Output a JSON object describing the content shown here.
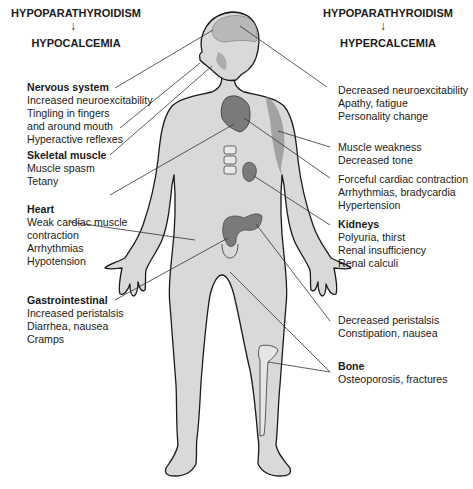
{
  "left_header": {
    "cause": "HYPOPARATHYROIDISM",
    "arrow": "↓",
    "effect": "HYPOCALCEMIA"
  },
  "right_header": {
    "cause": "HYPOPARATHYROIDISM",
    "arrow": "↓",
    "effect": "HYPERCALCEMIA"
  },
  "left_blocks": [
    {
      "title": "Nervous system",
      "lines": [
        "Increased neuroexcitability",
        "Tingling in fingers",
        "and around mouth",
        "Hyperactive reflexes"
      ]
    },
    {
      "title": "Skeletal muscle",
      "lines": [
        "Muscle spasm",
        "Tetany"
      ]
    },
    {
      "title": "Heart",
      "lines": [
        "Weak cardiac muscle",
        "contraction",
        "Arrhythmias",
        "Hypotension"
      ]
    },
    {
      "title": "Gastrointestinal",
      "lines": [
        "Increased peristalsis",
        "Diarrhea, nausea",
        "Cramps"
      ]
    }
  ],
  "right_blocks": [
    {
      "title": "",
      "lines": [
        "Decreased neuroexcitability",
        "Apathy, fatigue",
        "Personality change"
      ]
    },
    {
      "title": "",
      "lines": [
        "Muscle weakness",
        "Decreased tone"
      ]
    },
    {
      "title": "",
      "lines": [
        "Forceful cardiac contraction",
        "Arrhythmias, bradycardia",
        "Hypertension"
      ]
    },
    {
      "title": "Kidneys",
      "lines": [
        "Polyuria, thirst",
        "Renal insufficiency",
        "Renal calculi"
      ]
    },
    {
      "title": "",
      "lines": [
        "Decreased peristalsis",
        "Constipation, nausea"
      ]
    },
    {
      "title": "Bone",
      "lines": [
        "Osteoporosis, fractures"
      ]
    }
  ],
  "colors": {
    "skin": "#d9d9d9",
    "outline": "#1a1a1a",
    "organ": "#7a7a7a",
    "brain": "#b8b8b8",
    "leader": "#333333"
  }
}
